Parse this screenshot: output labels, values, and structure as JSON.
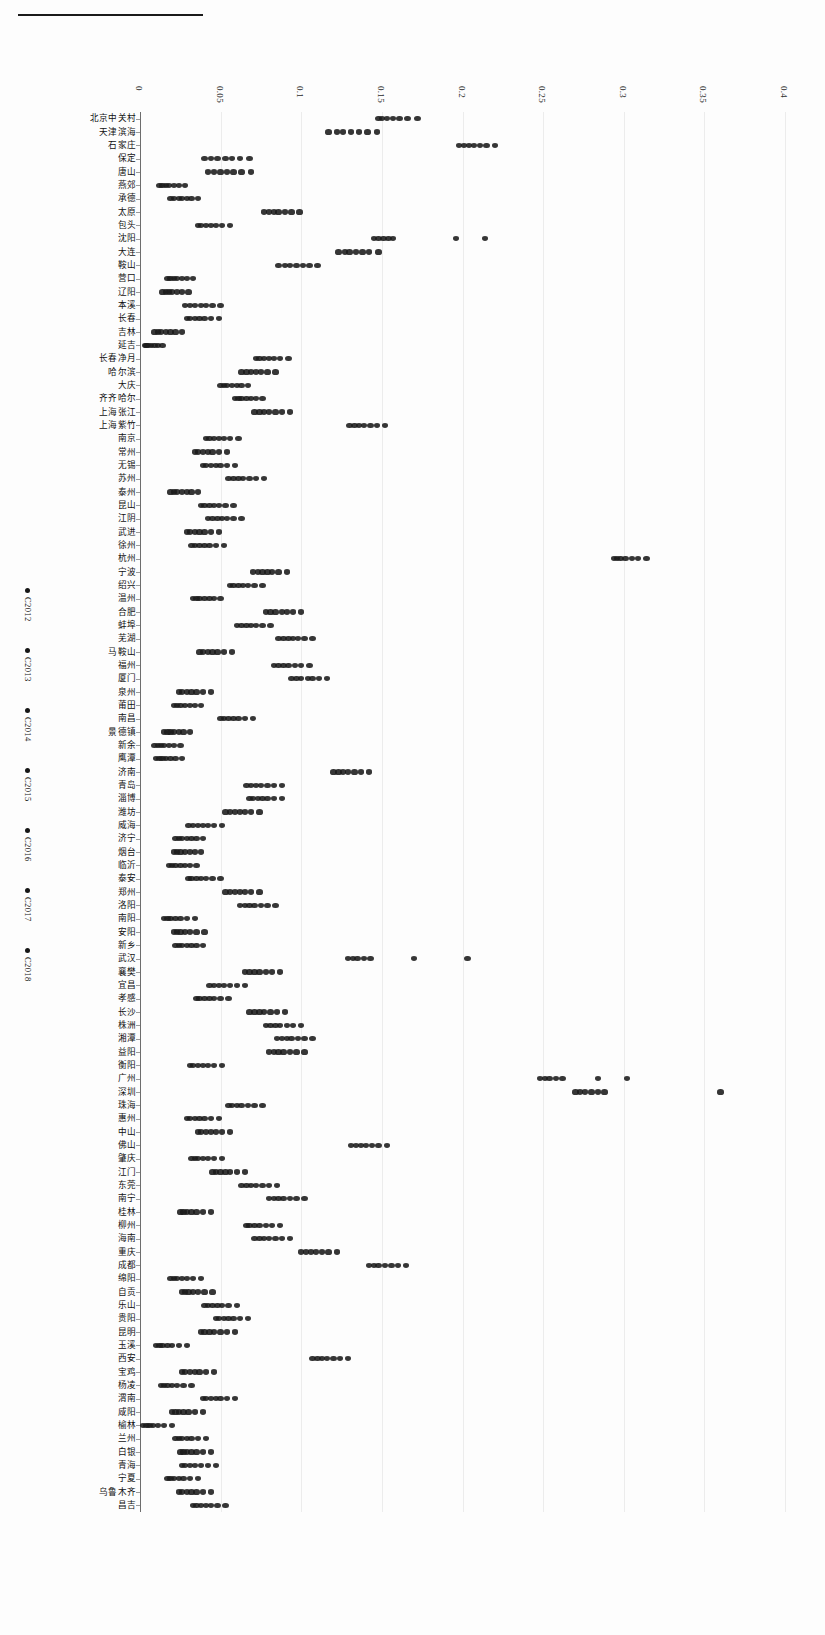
{
  "chart_data": {
    "type": "scatter",
    "title": "",
    "subtitle": "",
    "xlabel": "",
    "ylabel": "",
    "orientation": "horizontal-strip",
    "grid": true,
    "legend_position": "left-bottom",
    "xlim": [
      0,
      0.4
    ],
    "xticks": [
      "0",
      "0.05",
      "0.1",
      "0.15",
      "0.2",
      "0.25",
      "0.3",
      "0.35",
      "0.4"
    ],
    "xtick_values": [
      0,
      0.05,
      0.1,
      0.15,
      0.2,
      0.25,
      0.3,
      0.35,
      0.4
    ],
    "legend": [
      "C2012",
      "C2013",
      "C2014",
      "C2015",
      "C2016",
      "C2017",
      "C2018"
    ],
    "series_colors": [
      "#1a1a1a",
      "#1a1a1a",
      "#1a1a1a",
      "#1a1a1a",
      "#1a1a1a",
      "#1a1a1a",
      "#1a1a1a"
    ],
    "categories": [
      "北京中关村",
      "天津滨海",
      "石家庄",
      "保定",
      "唐山",
      "燕郊",
      "承德",
      "太原",
      "包头",
      "沈阳",
      "大连",
      "鞍山",
      "营口",
      "辽阳",
      "本溪",
      "长春",
      "吉林",
      "延吉",
      "长春净月",
      "哈尔滨",
      "大庆",
      "齐齐哈尔",
      "上海张江",
      "上海紫竹",
      "南京",
      "常州",
      "无锡",
      "苏州",
      "泰州",
      "昆山",
      "江阴",
      "武进",
      "徐州",
      "杭州",
      "宁波",
      "绍兴",
      "温州",
      "合肥",
      "蚌埠",
      "芜湖",
      "马鞍山",
      "福州",
      "厦门",
      "泉州",
      "莆田",
      "南昌",
      "景德镇",
      "新余",
      "鹰潭",
      "济南",
      "青岛",
      "淄博",
      "潍坊",
      "威海",
      "济宁",
      "烟台",
      "临沂",
      "泰安",
      "郑州",
      "洛阳",
      "南阳",
      "安阳",
      "新乡",
      "武汉",
      "襄樊",
      "宜昌",
      "孝感",
      "长沙",
      "株洲",
      "湘潭",
      "益阳",
      "衡阳",
      "广州",
      "深圳",
      "珠海",
      "惠州",
      "中山",
      "佛山",
      "肇庆",
      "江门",
      "东莞",
      "南宁",
      "桂林",
      "柳州",
      "海南",
      "重庆",
      "成都",
      "绵阳",
      "自贡",
      "乐山",
      "贵阳",
      "昆明",
      "玉溪",
      "西安",
      "宝鸡",
      "杨凌",
      "渭南",
      "咸阳",
      "榆林",
      "兰州",
      "白银",
      "青海",
      "宁夏",
      "乌鲁木齐",
      "昌吉"
    ],
    "series": [
      {
        "name": "C2012",
        "values": [
          0.148,
          0.117,
          0.198,
          0.04,
          0.042,
          0.012,
          0.019,
          0.077,
          0.036,
          0.145,
          0.123,
          0.086,
          0.017,
          0.014,
          0.028,
          0.029,
          0.009,
          0.003,
          0.072,
          0.063,
          0.05,
          0.059,
          0.071,
          0.13,
          0.041,
          0.034,
          0.039,
          0.055,
          0.019,
          0.038,
          0.042,
          0.029,
          0.032,
          0.294,
          0.07,
          0.056,
          0.033,
          0.078,
          0.06,
          0.086,
          0.037,
          0.083,
          0.094,
          0.024,
          0.021,
          0.05,
          0.015,
          0.009,
          0.01,
          0.12,
          0.066,
          0.068,
          0.053,
          0.03,
          0.022,
          0.021,
          0.018,
          0.03,
          0.053,
          0.062,
          0.015,
          0.021,
          0.022,
          0.129,
          0.065,
          0.043,
          0.035,
          0.068,
          0.078,
          0.085,
          0.08,
          0.031,
          0.248,
          0.27,
          0.055,
          0.029,
          0.036,
          0.131,
          0.032,
          0.045,
          0.063,
          0.08,
          0.025,
          0.066,
          0.071,
          0.1,
          0.142,
          0.019,
          0.026,
          0.04,
          0.047,
          0.038,
          0.01,
          0.107,
          0.026,
          0.013,
          0.039,
          0.02,
          0.002,
          0.022,
          0.025,
          0.026,
          0.017,
          0.024,
          0.033
        ]
      },
      {
        "name": "C2013",
        "values": [
          0.15,
          0.122,
          0.201,
          0.044,
          0.046,
          0.014,
          0.021,
          0.08,
          0.038,
          0.148,
          0.127,
          0.09,
          0.019,
          0.016,
          0.031,
          0.031,
          0.011,
          0.004,
          0.074,
          0.066,
          0.052,
          0.061,
          0.074,
          0.133,
          0.043,
          0.036,
          0.041,
          0.058,
          0.021,
          0.04,
          0.045,
          0.031,
          0.034,
          0.296,
          0.073,
          0.058,
          0.035,
          0.081,
          0.063,
          0.089,
          0.039,
          0.086,
          0.097,
          0.026,
          0.023,
          0.052,
          0.017,
          0.011,
          0.012,
          0.123,
          0.069,
          0.07,
          0.056,
          0.033,
          0.024,
          0.023,
          0.02,
          0.032,
          0.056,
          0.065,
          0.017,
          0.023,
          0.024,
          0.132,
          0.068,
          0.046,
          0.037,
          0.071,
          0.081,
          0.088,
          0.083,
          0.033,
          0.251,
          0.273,
          0.057,
          0.031,
          0.038,
          0.134,
          0.034,
          0.047,
          0.066,
          0.083,
          0.027,
          0.068,
          0.074,
          0.103,
          0.145,
          0.021,
          0.028,
          0.042,
          0.049,
          0.04,
          0.012,
          0.11,
          0.028,
          0.015,
          0.041,
          0.022,
          0.004,
          0.024,
          0.027,
          0.028,
          0.019,
          0.026,
          0.035
        ]
      },
      {
        "name": "C2014",
        "values": [
          0.153,
          0.126,
          0.204,
          0.048,
          0.05,
          0.016,
          0.024,
          0.083,
          0.041,
          0.151,
          0.13,
          0.093,
          0.021,
          0.018,
          0.034,
          0.034,
          0.013,
          0.005,
          0.077,
          0.069,
          0.054,
          0.063,
          0.077,
          0.136,
          0.046,
          0.039,
          0.044,
          0.061,
          0.023,
          0.043,
          0.048,
          0.034,
          0.037,
          0.298,
          0.076,
          0.061,
          0.037,
          0.084,
          0.066,
          0.092,
          0.042,
          0.089,
          0.1,
          0.029,
          0.025,
          0.055,
          0.019,
          0.013,
          0.014,
          0.126,
          0.072,
          0.073,
          0.059,
          0.036,
          0.026,
          0.025,
          0.022,
          0.035,
          0.059,
          0.068,
          0.019,
          0.025,
          0.026,
          0.135,
          0.071,
          0.049,
          0.04,
          0.074,
          0.084,
          0.091,
          0.086,
          0.036,
          0.254,
          0.276,
          0.06,
          0.034,
          0.041,
          0.137,
          0.036,
          0.05,
          0.069,
          0.086,
          0.029,
          0.071,
          0.077,
          0.106,
          0.148,
          0.023,
          0.03,
          0.045,
          0.052,
          0.043,
          0.014,
          0.113,
          0.031,
          0.017,
          0.044,
          0.024,
          0.006,
          0.026,
          0.029,
          0.031,
          0.021,
          0.029,
          0.038
        ]
      },
      {
        "name": "C2015",
        "values": [
          0.157,
          0.131,
          0.207,
          0.053,
          0.054,
          0.018,
          0.026,
          0.086,
          0.044,
          0.154,
          0.134,
          0.097,
          0.023,
          0.02,
          0.038,
          0.037,
          0.016,
          0.007,
          0.08,
          0.072,
          0.057,
          0.066,
          0.08,
          0.139,
          0.049,
          0.042,
          0.047,
          0.064,
          0.026,
          0.046,
          0.051,
          0.037,
          0.04,
          0.301,
          0.079,
          0.064,
          0.04,
          0.088,
          0.069,
          0.095,
          0.045,
          0.092,
          0.104,
          0.032,
          0.028,
          0.058,
          0.021,
          0.015,
          0.016,
          0.129,
          0.075,
          0.076,
          0.062,
          0.039,
          0.029,
          0.028,
          0.025,
          0.038,
          0.062,
          0.071,
          0.022,
          0.028,
          0.029,
          0.139,
          0.074,
          0.052,
          0.043,
          0.077,
          0.087,
          0.094,
          0.089,
          0.039,
          0.258,
          0.28,
          0.063,
          0.037,
          0.044,
          0.14,
          0.039,
          0.053,
          0.072,
          0.089,
          0.032,
          0.074,
          0.08,
          0.109,
          0.152,
          0.026,
          0.033,
          0.048,
          0.055,
          0.046,
          0.017,
          0.116,
          0.034,
          0.02,
          0.047,
          0.027,
          0.008,
          0.029,
          0.032,
          0.034,
          0.024,
          0.032,
          0.041
        ]
      },
      {
        "name": "C2016",
        "values": [
          0.161,
          0.136,
          0.211,
          0.057,
          0.058,
          0.021,
          0.029,
          0.09,
          0.047,
          0.157,
          0.138,
          0.101,
          0.026,
          0.023,
          0.041,
          0.04,
          0.019,
          0.009,
          0.083,
          0.075,
          0.06,
          0.069,
          0.084,
          0.143,
          0.052,
          0.045,
          0.05,
          0.068,
          0.029,
          0.049,
          0.054,
          0.04,
          0.043,
          0.305,
          0.082,
          0.067,
          0.043,
          0.091,
          0.072,
          0.098,
          0.048,
          0.096,
          0.107,
          0.035,
          0.031,
          0.061,
          0.024,
          0.018,
          0.019,
          0.133,
          0.079,
          0.079,
          0.065,
          0.042,
          0.032,
          0.031,
          0.028,
          0.041,
          0.065,
          0.075,
          0.025,
          0.031,
          0.032,
          0.143,
          0.078,
          0.056,
          0.046,
          0.081,
          0.091,
          0.098,
          0.093,
          0.042,
          0.262,
          0.284,
          0.067,
          0.04,
          0.047,
          0.144,
          0.042,
          0.056,
          0.076,
          0.093,
          0.035,
          0.078,
          0.084,
          0.113,
          0.156,
          0.029,
          0.036,
          0.051,
          0.058,
          0.05,
          0.02,
          0.12,
          0.037,
          0.023,
          0.05,
          0.03,
          0.011,
          0.032,
          0.035,
          0.038,
          0.027,
          0.035,
          0.044
        ]
      },
      {
        "name": "C2017",
        "values": [
          0.166,
          0.141,
          0.215,
          0.062,
          0.063,
          0.024,
          0.032,
          0.094,
          0.051,
          0.196,
          0.142,
          0.105,
          0.029,
          0.026,
          0.045,
          0.044,
          0.022,
          0.011,
          0.087,
          0.079,
          0.063,
          0.072,
          0.088,
          0.147,
          0.056,
          0.049,
          0.054,
          0.072,
          0.032,
          0.053,
          0.058,
          0.044,
          0.047,
          0.309,
          0.086,
          0.071,
          0.046,
          0.095,
          0.076,
          0.102,
          0.052,
          0.1,
          0.111,
          0.039,
          0.034,
          0.065,
          0.027,
          0.021,
          0.022,
          0.137,
          0.083,
          0.083,
          0.069,
          0.046,
          0.035,
          0.034,
          0.031,
          0.045,
          0.069,
          0.079,
          0.029,
          0.035,
          0.035,
          0.17,
          0.082,
          0.06,
          0.05,
          0.085,
          0.095,
          0.102,
          0.097,
          0.046,
          0.284,
          0.288,
          0.071,
          0.044,
          0.051,
          0.148,
          0.046,
          0.06,
          0.08,
          0.097,
          0.039,
          0.082,
          0.088,
          0.117,
          0.16,
          0.033,
          0.04,
          0.055,
          0.062,
          0.054,
          0.024,
          0.124,
          0.041,
          0.027,
          0.054,
          0.034,
          0.015,
          0.036,
          0.039,
          0.042,
          0.031,
          0.039,
          0.048
        ]
      },
      {
        "name": "C2018",
        "values": [
          0.172,
          0.147,
          0.22,
          0.068,
          0.069,
          0.028,
          0.036,
          0.099,
          0.056,
          0.214,
          0.148,
          0.11,
          0.033,
          0.03,
          0.05,
          0.049,
          0.026,
          0.014,
          0.092,
          0.084,
          0.067,
          0.076,
          0.093,
          0.152,
          0.061,
          0.054,
          0.059,
          0.077,
          0.036,
          0.058,
          0.063,
          0.049,
          0.052,
          0.314,
          0.091,
          0.076,
          0.05,
          0.1,
          0.081,
          0.107,
          0.057,
          0.105,
          0.116,
          0.044,
          0.038,
          0.07,
          0.031,
          0.025,
          0.026,
          0.142,
          0.088,
          0.088,
          0.074,
          0.051,
          0.039,
          0.038,
          0.035,
          0.05,
          0.074,
          0.084,
          0.034,
          0.04,
          0.039,
          0.203,
          0.087,
          0.065,
          0.055,
          0.09,
          0.1,
          0.107,
          0.102,
          0.051,
          0.302,
          0.36,
          0.076,
          0.049,
          0.056,
          0.153,
          0.051,
          0.065,
          0.085,
          0.102,
          0.044,
          0.087,
          0.093,
          0.122,
          0.165,
          0.038,
          0.045,
          0.06,
          0.067,
          0.059,
          0.029,
          0.129,
          0.046,
          0.032,
          0.059,
          0.039,
          0.02,
          0.041,
          0.044,
          0.047,
          0.036,
          0.044,
          0.053
        ]
      }
    ]
  }
}
